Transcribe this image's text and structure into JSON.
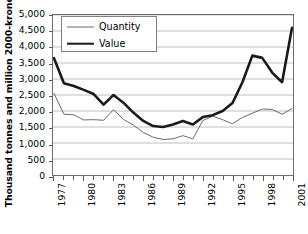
{
  "chart_data": {
    "type": "line",
    "title": "",
    "xlabel": "",
    "ylabel": "Thousand tonnes and million 2000-kroner",
    "ylim": [
      0,
      5000
    ],
    "ytick_values": [
      0,
      500,
      1000,
      1500,
      2000,
      2500,
      3000,
      3500,
      4000,
      4500,
      5000
    ],
    "ytick_labels": [
      "0",
      "500",
      "1,000",
      "1,500",
      "2,000",
      "2,500",
      "3,000",
      "3,500",
      "4,000",
      "4,500",
      "5,000"
    ],
    "grid": true,
    "grid_axis": "y",
    "legend_position": "upper-left",
    "x": [
      1977,
      1978,
      1979,
      1980,
      1981,
      1982,
      1983,
      1984,
      1985,
      1986,
      1987,
      1988,
      1989,
      1990,
      1991,
      1992,
      1993,
      1994,
      1995,
      1996,
      1997,
      1998,
      1999,
      2000,
      2001
    ],
    "xtick_labels": [
      "1977",
      "1980",
      "1983",
      "1986",
      "1989",
      "1992",
      "1995",
      "1998",
      "2001"
    ],
    "xtick_label_values": [
      1977,
      1980,
      1983,
      1986,
      1989,
      1992,
      1995,
      1998,
      2001
    ],
    "series": [
      {
        "name": "Quantity",
        "style": "thin",
        "color": "#6b6b6b",
        "values": [
          2550,
          1900,
          1880,
          1720,
          1730,
          1710,
          2040,
          1740,
          1560,
          1330,
          1180,
          1110,
          1130,
          1230,
          1130,
          1700,
          1840,
          1730,
          1600,
          1800,
          1930,
          2060,
          2050,
          1900,
          2080
        ]
      },
      {
        "name": "Value",
        "style": "thick",
        "color": "#1a1a1a",
        "values": [
          3650,
          2870,
          2780,
          2660,
          2530,
          2200,
          2500,
          2260,
          1950,
          1690,
          1530,
          1500,
          1580,
          1690,
          1580,
          1810,
          1870,
          2000,
          2250,
          2900,
          3730,
          3660,
          3200,
          2900,
          4600
        ]
      }
    ]
  },
  "legend": {
    "items": [
      {
        "label": "Quantity"
      },
      {
        "label": "Value"
      }
    ]
  },
  "axes": {
    "y_title": "Thousand tonnes and million 2000-kroner"
  }
}
